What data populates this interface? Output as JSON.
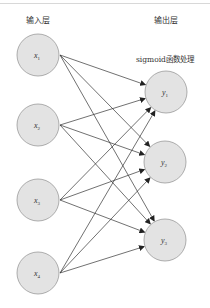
{
  "diagram": {
    "input_layer_label": "输入层",
    "output_layer_label": "输出层",
    "activation_label": "sigmoid函数处理",
    "inputs": [
      {
        "id": "x1",
        "var": "x",
        "sub": "1",
        "cx": 38,
        "cy": 55
      },
      {
        "id": "x2",
        "var": "x",
        "sub": "2",
        "cx": 38,
        "cy": 125
      },
      {
        "id": "x3",
        "var": "x",
        "sub": "3",
        "cx": 38,
        "cy": 200
      },
      {
        "id": "x4",
        "var": "x",
        "sub": "4",
        "cx": 38,
        "cy": 273
      }
    ],
    "outputs": [
      {
        "id": "y1",
        "var": "y",
        "sub": "1",
        "cx": 166,
        "cy": 92
      },
      {
        "id": "y2",
        "var": "y",
        "sub": "2",
        "cx": 165,
        "cy": 162
      },
      {
        "id": "y3",
        "var": "y",
        "sub": "3",
        "cx": 165,
        "cy": 240
      }
    ],
    "node_radius": 21,
    "colors": {
      "node_fill": "#e3e3e3",
      "node_stroke": "#9a9a9a",
      "edge": "#333333"
    },
    "connection": "fully-connected"
  }
}
